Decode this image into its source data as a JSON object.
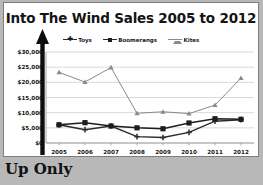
{
  "chart_data": {
    "type": "line",
    "title": "Into The Wind Sales 2005 to 2012",
    "xlabel": "",
    "ylabel": "",
    "categories": [
      "2005",
      "2006",
      "2007",
      "2008",
      "2009",
      "2010",
      "2011",
      "2012"
    ],
    "ylim": [
      0,
      30000
    ],
    "yticks": [
      0,
      5000,
      10000,
      15000,
      20000,
      25000,
      30000
    ],
    "ytick_labels": [
      "$0",
      "$5,000",
      "$10,000",
      "$15,000",
      "$20,000",
      "$25,000",
      "$30,000"
    ],
    "grid": true,
    "legend_position": "top",
    "series": [
      {
        "name": "Toys",
        "marker": "cross",
        "color": "#2b2b2b",
        "values": [
          6000,
          4400,
          5600,
          2100,
          1800,
          3500,
          7200,
          7700
        ]
      },
      {
        "name": "Boomerangs",
        "marker": "square",
        "color": "#1c1c1c",
        "values": [
          6000,
          6700,
          5600,
          5000,
          4700,
          6600,
          8000,
          7800
        ]
      },
      {
        "name": "Kites",
        "marker": "triangle",
        "color": "#8a8a8a",
        "values": [
          23300,
          20100,
          24900,
          9800,
          10300,
          9700,
          12500,
          21400
        ]
      }
    ]
  },
  "annotations": {
    "up_arrow": "up-arrow-overlay"
  },
  "caption": {
    "text": "Up Only"
  }
}
